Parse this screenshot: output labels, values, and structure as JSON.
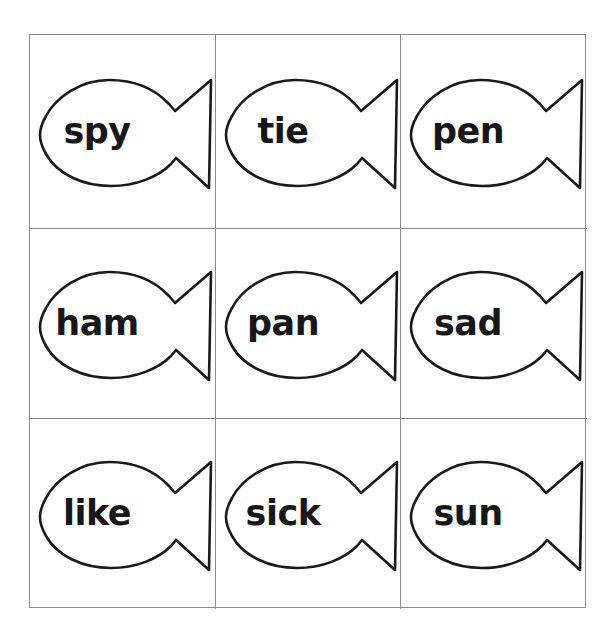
{
  "worksheet": {
    "title": "Fish Word Cards",
    "background_color": "#ffffff",
    "grid": {
      "rows": 3,
      "columns": 3,
      "border_color": "#8c8c8c"
    },
    "shape": {
      "name": "fish-outline",
      "fill_color": "#ffffff",
      "stroke_color": "#1a1a1a"
    },
    "cards": [
      {
        "word": "spy",
        "row": 1,
        "column": 1
      },
      {
        "word": "tie",
        "row": 1,
        "column": 2
      },
      {
        "word": "pen",
        "row": 1,
        "column": 3
      },
      {
        "word": "ham",
        "row": 2,
        "column": 1
      },
      {
        "word": "pan",
        "row": 2,
        "column": 2
      },
      {
        "word": "sad",
        "row": 2,
        "column": 3
      },
      {
        "word": "like",
        "row": 3,
        "column": 1
      },
      {
        "word": "sick",
        "row": 3,
        "column": 2
      },
      {
        "word": "sun",
        "row": 3,
        "column": 3
      }
    ]
  }
}
